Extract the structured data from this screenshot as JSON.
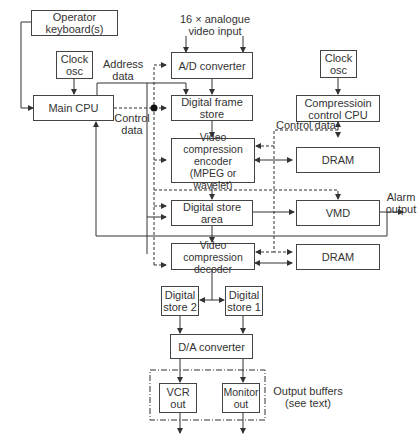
{
  "diagram": {
    "type": "block-diagram",
    "blocks": {
      "operator_keyboard": "Operator\nkeyboard(s)",
      "clock_osc_left": "Clock\nosc",
      "main_cpu": "Main CPU",
      "ad_converter": "A/D converter",
      "digital_frame_store": "Digital frame\nstore",
      "video_compression_encoder": "Video compression\nencoder\n(MPEG or wavelet)",
      "digital_store_area": "Digital store\narea",
      "video_compression_decoder": "Video compression\ndecoder",
      "clock_osc_right": "Clock\nosc",
      "compression_control_cpu": "Compressioin\ncontrol CPU",
      "dram_top": "DRAM",
      "vmd": "VMD",
      "dram_bottom": "DRAM",
      "digital_store_2": "Digital\nstore 2",
      "digital_store_1": "Digital\nstore 1",
      "da_converter": "D/A converter",
      "vcr_out": "VCR\nout",
      "monitor_out": "Monitor\nout"
    },
    "labels": {
      "video_input": "16 × analogue\nvideo input",
      "address_data": "Address\ndata",
      "control_data_left": "Control\ndata",
      "control_data_right": "Control data",
      "alarm_output": "Alarm\noutput",
      "output_buffers": "Output buffers\n(see text)"
    }
  }
}
